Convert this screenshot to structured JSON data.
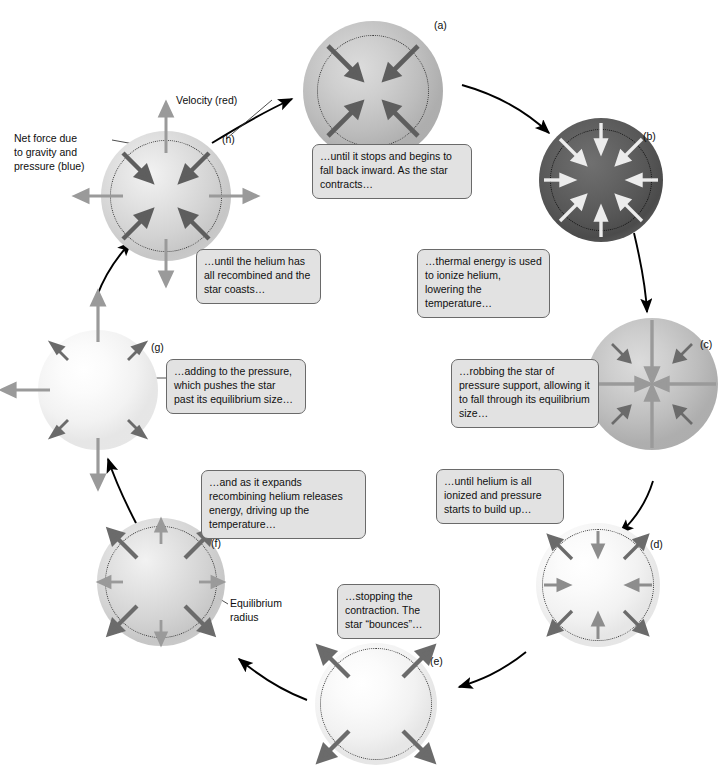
{
  "figure": {
    "title_hidden": "",
    "legend": {
      "velocity_label": "Velocity (red)",
      "netforce_label": "Net force due\nto gravity and\npressure (blue)",
      "equilibrium_label": "Equilibrium\nradius"
    },
    "colors": {
      "velocity_arrow": "#9a9a9a",
      "netforce_arrow": "#5f5f5f",
      "netforce_arrow_light": "#e8e8e8",
      "connector": "#000000",
      "caption_fill": "#e2e2e2",
      "caption_border": "#6a6a6a",
      "star_ring": "#3a3a3a",
      "page_background": "#ffffff"
    },
    "stages": [
      {
        "id": "a",
        "tag": "(a)",
        "caption": "…until it stops and begins to fall back inward. As the star contracts…",
        "brightness": "gray",
        "velocity_arrows": "none",
        "force_arrows": "inward-diagonal-dark"
      },
      {
        "id": "b",
        "tag": "(b)",
        "caption": "…thermal energy is used to ionize helium, lowering the temperature…",
        "brightness": "dark",
        "velocity_arrows": "inward-cardinal-light",
        "force_arrows": "inward-diagonal-light"
      },
      {
        "id": "c",
        "tag": "(c)",
        "caption": "…robbing the star of pressure support, allowing it to fall through its equilibrium size…",
        "brightness": "gray",
        "velocity_arrows": "inward-cardinal-long",
        "force_arrows": "inward-diagonal-short"
      },
      {
        "id": "d",
        "tag": "(d)",
        "caption": "…until helium is all ionized and pressure starts to build up…",
        "brightness": "bright",
        "velocity_arrows": "inward-cardinal",
        "force_arrows": "outward-diagonal"
      },
      {
        "id": "e",
        "tag": "(e)",
        "caption": "…stopping the contraction. The star “bounces”…",
        "brightness": "bright",
        "velocity_arrows": "none",
        "force_arrows": "outward-diagonal-long"
      },
      {
        "id": "f",
        "tag": "(f)",
        "caption": "…and as it expands recombining helium releases energy, driving up the temperature…",
        "brightness": "mid",
        "velocity_arrows": "outward-cardinal",
        "force_arrows": "outward-diagonal"
      },
      {
        "id": "g",
        "tag": "(g)",
        "caption": "…adding to the pressure, which pushes the star past its equilibrium size…",
        "brightness": "bright",
        "velocity_arrows": "outward-cardinal-long",
        "force_arrows": "outward-diagonal-short"
      },
      {
        "id": "h",
        "tag": "(h)",
        "caption": "…until the helium has all recombined and the star coasts…",
        "brightness": "mid",
        "velocity_arrows": "outward-cardinal",
        "force_arrows": "inward-diagonal-dark"
      }
    ]
  }
}
